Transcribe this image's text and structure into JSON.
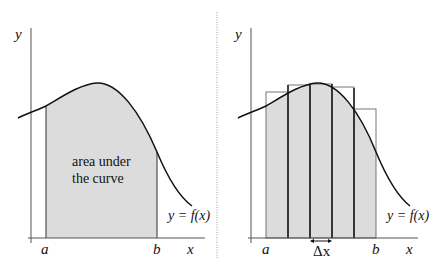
{
  "colors": {
    "fill": "#dcdcdc",
    "line": "#111111",
    "axis": "#555555",
    "divider": "#9a9a9a"
  },
  "left_panel": {
    "y_axis_label": "y",
    "x_axis_label": "x",
    "a_label": "a",
    "b_label": "b",
    "curve_label": "y = f(x)",
    "area_label_line1": "area under",
    "area_label_line2": "the curve"
  },
  "right_panel": {
    "y_axis_label": "y",
    "x_axis_label": "x",
    "a_label": "a",
    "b_label": "b",
    "curve_label": "y = f(x)",
    "delta_label": "Δx",
    "rectangle_count": 5
  }
}
